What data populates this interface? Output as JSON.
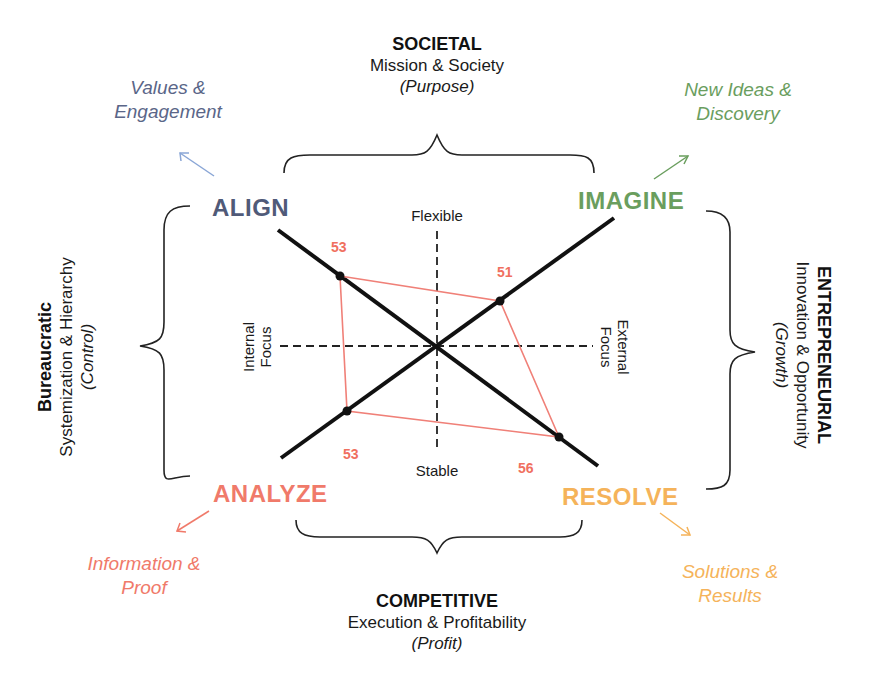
{
  "colors": {
    "align": "#505a78",
    "imagine": "#6a9e5e",
    "analyze": "#f07a6a",
    "resolve": "#f5b35a",
    "align_outcome": "#5a6688",
    "align_arrow": "#8aa6d6",
    "polygon": "#f08078",
    "score": "#f07060",
    "axis": "#111111"
  },
  "top": {
    "title": "SOCIETAL",
    "subtitle": "Mission & Society",
    "focus": "(Purpose)"
  },
  "bottom": {
    "title": "COMPETITIVE",
    "subtitle": "Execution & Profitability",
    "focus": "(Profit)"
  },
  "left": {
    "title": "Bureaucratic",
    "subtitle": "Systemization & Hierarchy",
    "focus": "(Control)"
  },
  "right": {
    "title": "ENTREPRENEURIAL",
    "subtitle": "Innovation & Opportunity",
    "focus": "(Growth)"
  },
  "quadrants": {
    "align": {
      "label": "ALIGN",
      "outcome_line1": "Values &",
      "outcome_line2": "Engagement",
      "score": "53"
    },
    "imagine": {
      "label": "IMAGINE",
      "outcome_line1": "New Ideas &",
      "outcome_line2": "Discovery",
      "score": "51"
    },
    "analyze": {
      "label": "ANALYZE",
      "outcome_line1": "Information &",
      "outcome_line2": "Proof",
      "score": "53"
    },
    "resolve": {
      "label": "RESOLVE",
      "outcome_line1": "Solutions &",
      "outcome_line2": "Results",
      "score": "56"
    }
  },
  "axes": {
    "top": "Flexible",
    "bottom": "Stable",
    "left_line1": "Internal",
    "left_line2": "Focus",
    "right_line1": "External",
    "right_line2": "Focus"
  },
  "profile": {
    "align": 53,
    "imagine": 51,
    "analyze": 53,
    "resolve": 56
  }
}
